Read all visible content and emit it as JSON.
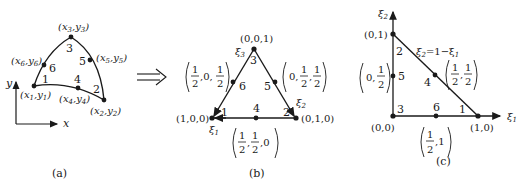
{
  "panels": {
    "a": {
      "caption": "(a)",
      "axes": {
        "x": "x",
        "y": "y"
      },
      "nodes": [
        {
          "id": "1",
          "label": "1",
          "coord": "(x1,y1)",
          "sub": "1"
        },
        {
          "id": "2",
          "label": "2",
          "coord": "(x2,y2)",
          "sub": "2"
        },
        {
          "id": "3",
          "label": "3",
          "coord": "(x3,y3)",
          "sub": "3"
        },
        {
          "id": "4",
          "label": "4",
          "coord": "(x4,y4)",
          "sub": "4"
        },
        {
          "id": "5",
          "label": "5",
          "coord": "(x5,y5)",
          "sub": "5"
        },
        {
          "id": "6",
          "label": "6",
          "coord": "(x6,y6)",
          "sub": "6"
        }
      ]
    },
    "arrow": "⟹",
    "b": {
      "caption": "(b)",
      "vertices": {
        "v1": "(1,0,0)",
        "v2": "(0,1,0)",
        "v3": "(0,0,1)"
      },
      "axis_labels": {
        "xi1": "ξ",
        "xi1_sub": "1",
        "xi2": "ξ",
        "xi2_sub": "2",
        "xi3": "ξ",
        "xi3_sub": "3"
      },
      "node_labels": [
        "1",
        "2",
        "3",
        "4",
        "5",
        "6"
      ],
      "midpoints": {
        "m4": {
          "a": "1",
          "b": "2",
          "c": "1",
          "d": "2",
          "tail": ",0",
          "sep": ","
        },
        "m5": {
          "lead": "0,",
          "a": "1",
          "b": "2",
          "c": "1",
          "d": "2",
          "sep": ","
        },
        "m6": {
          "a": "1",
          "b": "2",
          "mid": ",0,",
          "c": "1",
          "d": "2"
        }
      }
    },
    "c": {
      "caption": "(c)",
      "axis_labels": {
        "xi1": "ξ",
        "xi1_sub": "1",
        "xi2": "ξ",
        "xi2_sub": "2"
      },
      "vertices": {
        "origin": "(0,0)",
        "v10": "(1,0)",
        "v01": "(0,1)"
      },
      "hypotenuse_eq": {
        "lhs": "ξ",
        "lhs_sub": "2",
        "rhs": "=1−ξ",
        "rhs_sub": "1"
      },
      "node_labels": [
        "1",
        "2",
        "3",
        "4",
        "5",
        "6"
      ],
      "midpoints": {
        "m4": {
          "a": "1",
          "b": "2",
          "sep": ",",
          "c": "1",
          "d": "2"
        },
        "m5": {
          "lead": "0,",
          "a": "1",
          "b": "2"
        },
        "m6": {
          "a": "1",
          "b": "2",
          "tail": ",1"
        }
      }
    }
  }
}
